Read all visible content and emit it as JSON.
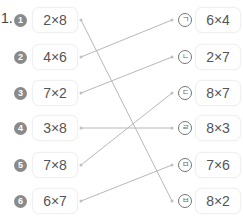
{
  "problem_number": "1.",
  "left": [
    {
      "badge": "1",
      "expr": "2×8",
      "y": 20
    },
    {
      "badge": "2",
      "expr": "4×6",
      "y": 57
    },
    {
      "badge": "3",
      "expr": "7×2",
      "y": 93
    },
    {
      "badge": "4",
      "expr": "3×8",
      "y": 128
    },
    {
      "badge": "5",
      "expr": "7×8",
      "y": 165
    },
    {
      "badge": "6",
      "expr": "6×7",
      "y": 201
    }
  ],
  "right": [
    {
      "label": "ㄱ",
      "expr": "6×4",
      "y": 20
    },
    {
      "label": "ㄴ",
      "expr": "2×7",
      "y": 57
    },
    {
      "label": "ㄷ",
      "expr": "8×7",
      "y": 93
    },
    {
      "label": "ㄹ",
      "expr": "8×3",
      "y": 128
    },
    {
      "label": "ㅁ",
      "expr": "7×6",
      "y": 165
    },
    {
      "label": "ㅂ",
      "expr": "8×2",
      "y": 201
    }
  ],
  "connections": [
    {
      "from": "1",
      "to": "ㅂ"
    },
    {
      "from": "2",
      "to": "ㄱ"
    },
    {
      "from": "3",
      "to": "ㄴ"
    },
    {
      "from": "4",
      "to": "ㄹ"
    },
    {
      "from": "5",
      "to": "ㄷ"
    },
    {
      "from": "6",
      "to": "ㅁ"
    }
  ],
  "colors": {
    "line": "#b8b8b8",
    "badge": "#8a8a8a",
    "text": "#555555"
  }
}
